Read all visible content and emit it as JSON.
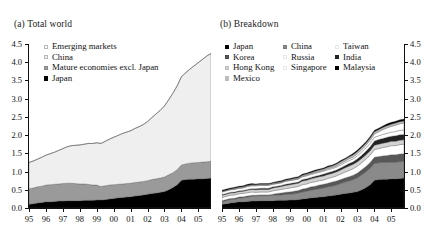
{
  "figure": {
    "panel_a_title": "(a) Total world",
    "panel_b_title": "(b) Breakdown"
  },
  "axes": {
    "y_ticks": [
      "0.0",
      "0.5",
      "1.0",
      "1.5",
      "2.0",
      "2.5",
      "3.0",
      "3.5",
      "4.0",
      "4.5"
    ],
    "x_ticks": [
      "95",
      "96",
      "97",
      "98",
      "99",
      "00",
      "01",
      "02",
      "03",
      "04",
      "05"
    ],
    "ylim": [
      0,
      4.5
    ],
    "xlim": [
      1995,
      2005.75
    ]
  },
  "colors": {
    "black": "#000000",
    "dark_gray": "#3b3b3b",
    "mid_gray": "#808080",
    "gray": "#a0a0a0",
    "light_gray": "#c9c9c9",
    "lighter_gray": "#dedede",
    "near_white": "#efefef",
    "white": "#ffffff",
    "axis": "#111111"
  },
  "legend_a": [
    {
      "label": "Emerging markets",
      "color": "#ffffff"
    },
    {
      "label": "China",
      "color": "#efefef"
    },
    {
      "label": "Mature economies excl. Japan",
      "color": "#9a9a9a"
    },
    {
      "label": "Japan",
      "color": "#000000"
    }
  ],
  "legend_b_columns": [
    [
      {
        "label": "Japan",
        "color": "#000000"
      },
      {
        "label": "Korea",
        "color": "#585858"
      },
      {
        "label": "Hong Kong",
        "color": "#d2d2d2"
      },
      {
        "label": "Mexico",
        "color": "#bdbdbd"
      }
    ],
    [
      {
        "label": "China",
        "color": "#8a8a8a"
      },
      {
        "label": "Russia",
        "color": "#ffffff"
      },
      {
        "label": "Singapore",
        "color": "#ffffff"
      }
    ],
    [
      {
        "label": "Taiwan",
        "color": "#ffffff"
      },
      {
        "label": "India",
        "color": "#222222"
      },
      {
        "label": "Malaysia",
        "color": "#000000"
      }
    ]
  ],
  "chart_data": [
    {
      "type": "area",
      "stacked": true,
      "title": "(a) Total world",
      "xlabel": "",
      "ylabel": "",
      "ylim": [
        0,
        4.5
      ],
      "grid": false,
      "legend_position": "top-left",
      "x": [
        1995.0,
        1995.25,
        1995.5,
        1995.75,
        1996.0,
        1996.25,
        1996.5,
        1996.75,
        1997.0,
        1997.25,
        1997.5,
        1997.75,
        1998.0,
        1998.25,
        1998.5,
        1998.75,
        1999.0,
        1999.25,
        1999.5,
        1999.75,
        2000.0,
        2000.25,
        2000.5,
        2000.75,
        2001.0,
        2001.25,
        2001.5,
        2001.75,
        2002.0,
        2002.25,
        2002.5,
        2002.75,
        2003.0,
        2003.25,
        2003.5,
        2003.75,
        2004.0,
        2004.25,
        2004.5,
        2004.75,
        2005.0,
        2005.25,
        2005.5,
        2005.75
      ],
      "x_tick_labels": [
        "95",
        "96",
        "97",
        "98",
        "99",
        "00",
        "01",
        "02",
        "03",
        "04",
        "05"
      ],
      "series": [
        {
          "name": "Japan",
          "color": "#000000",
          "values": [
            0.1,
            0.12,
            0.14,
            0.15,
            0.17,
            0.17,
            0.18,
            0.19,
            0.19,
            0.2,
            0.2,
            0.2,
            0.2,
            0.21,
            0.21,
            0.21,
            0.22,
            0.22,
            0.23,
            0.25,
            0.26,
            0.28,
            0.29,
            0.3,
            0.31,
            0.33,
            0.34,
            0.36,
            0.38,
            0.4,
            0.41,
            0.43,
            0.45,
            0.5,
            0.56,
            0.64,
            0.76,
            0.78,
            0.79,
            0.79,
            0.8,
            0.8,
            0.81,
            0.82
          ]
        },
        {
          "name": "Mature economies excl. Japan",
          "color": "#9a9a9a",
          "values": [
            0.43,
            0.43,
            0.44,
            0.45,
            0.46,
            0.47,
            0.47,
            0.47,
            0.48,
            0.48,
            0.48,
            0.47,
            0.46,
            0.45,
            0.44,
            0.42,
            0.41,
            0.37,
            0.38,
            0.38,
            0.38,
            0.37,
            0.37,
            0.37,
            0.37,
            0.37,
            0.37,
            0.37,
            0.37,
            0.38,
            0.39,
            0.39,
            0.4,
            0.41,
            0.41,
            0.41,
            0.42,
            0.43,
            0.44,
            0.45,
            0.45,
            0.46,
            0.46,
            0.46
          ]
        },
        {
          "name": "China",
          "color": "#efefef",
          "values": [
            0.72,
            0.74,
            0.76,
            0.79,
            0.82,
            0.85,
            0.88,
            0.92,
            0.96,
            1.0,
            1.03,
            1.05,
            1.07,
            1.09,
            1.12,
            1.14,
            1.16,
            1.18,
            1.22,
            1.26,
            1.3,
            1.34,
            1.38,
            1.41,
            1.44,
            1.48,
            1.52,
            1.56,
            1.62,
            1.7,
            1.78,
            1.86,
            1.95,
            2.06,
            2.18,
            2.3,
            2.42,
            2.5,
            2.58,
            2.66,
            2.74,
            2.82,
            2.9,
            2.96
          ]
        },
        {
          "name": "Emerging markets",
          "color": "#ffffff",
          "values": [
            0.0,
            0.0,
            0.0,
            0.0,
            0.0,
            0.0,
            0.0,
            0.0,
            0.0,
            0.0,
            0.0,
            0.0,
            0.0,
            0.0,
            0.0,
            0.0,
            0.0,
            0.0,
            0.0,
            0.0,
            0.0,
            0.0,
            0.0,
            0.0,
            0.0,
            0.0,
            0.0,
            0.0,
            0.0,
            0.0,
            0.0,
            0.0,
            0.0,
            0.0,
            0.0,
            0.0,
            0.0,
            0.0,
            0.0,
            0.0,
            0.0,
            0.0,
            0.0,
            0.0
          ]
        }
      ]
    },
    {
      "type": "area",
      "stacked": true,
      "title": "(b) Breakdown",
      "xlabel": "",
      "ylabel": "",
      "ylim": [
        0,
        4.5
      ],
      "grid": false,
      "legend_position": "top-left",
      "x": [
        1995.0,
        1995.25,
        1995.5,
        1995.75,
        1996.0,
        1996.25,
        1996.5,
        1996.75,
        1997.0,
        1997.25,
        1997.5,
        1997.75,
        1998.0,
        1998.25,
        1998.5,
        1998.75,
        1999.0,
        1999.25,
        1999.5,
        1999.75,
        2000.0,
        2000.25,
        2000.5,
        2000.75,
        2001.0,
        2001.25,
        2001.5,
        2001.75,
        2002.0,
        2002.25,
        2002.5,
        2002.75,
        2003.0,
        2003.25,
        2003.5,
        2003.75,
        2004.0,
        2004.25,
        2004.5,
        2004.75,
        2005.0,
        2005.25,
        2005.5,
        2005.75
      ],
      "x_tick_labels": [
        "95",
        "96",
        "97",
        "98",
        "99",
        "00",
        "01",
        "02",
        "03",
        "04",
        "05"
      ],
      "series": [
        {
          "name": "Japan",
          "color": "#000000",
          "values": [
            0.1,
            0.12,
            0.14,
            0.15,
            0.17,
            0.17,
            0.18,
            0.19,
            0.19,
            0.2,
            0.2,
            0.2,
            0.2,
            0.21,
            0.21,
            0.21,
            0.22,
            0.22,
            0.23,
            0.25,
            0.26,
            0.28,
            0.29,
            0.3,
            0.31,
            0.33,
            0.34,
            0.36,
            0.38,
            0.4,
            0.41,
            0.43,
            0.45,
            0.5,
            0.56,
            0.64,
            0.76,
            0.78,
            0.79,
            0.79,
            0.8,
            0.8,
            0.81,
            0.82
          ]
        },
        {
          "name": "China",
          "color": "#8a8a8a",
          "values": [
            0.07,
            0.08,
            0.09,
            0.09,
            0.1,
            0.11,
            0.12,
            0.13,
            0.14,
            0.14,
            0.14,
            0.14,
            0.15,
            0.15,
            0.15,
            0.16,
            0.16,
            0.17,
            0.18,
            0.19,
            0.2,
            0.21,
            0.22,
            0.23,
            0.24,
            0.25,
            0.26,
            0.27,
            0.29,
            0.31,
            0.33,
            0.35,
            0.38,
            0.41,
            0.43,
            0.45,
            0.46,
            0.46,
            0.46,
            0.46,
            0.46,
            0.46,
            0.46,
            0.46
          ]
        },
        {
          "name": "Korea",
          "color": "#585858",
          "values": [
            0.03,
            0.03,
            0.03,
            0.03,
            0.03,
            0.03,
            0.03,
            0.03,
            0.02,
            0.02,
            0.02,
            0.02,
            0.03,
            0.04,
            0.05,
            0.06,
            0.06,
            0.07,
            0.07,
            0.08,
            0.08,
            0.09,
            0.09,
            0.1,
            0.1,
            0.1,
            0.11,
            0.11,
            0.11,
            0.11,
            0.12,
            0.12,
            0.13,
            0.14,
            0.15,
            0.16,
            0.17,
            0.17,
            0.18,
            0.19,
            0.2,
            0.2,
            0.21,
            0.21
          ]
        },
        {
          "name": "Taiwan",
          "color": "#ffffff",
          "values": [
            0.09,
            0.09,
            0.09,
            0.09,
            0.09,
            0.09,
            0.09,
            0.09,
            0.08,
            0.08,
            0.08,
            0.08,
            0.09,
            0.09,
            0.1,
            0.1,
            0.11,
            0.11,
            0.11,
            0.12,
            0.12,
            0.12,
            0.12,
            0.12,
            0.12,
            0.13,
            0.13,
            0.14,
            0.15,
            0.16,
            0.17,
            0.18,
            0.19,
            0.19,
            0.2,
            0.2,
            0.21,
            0.22,
            0.23,
            0.24,
            0.25,
            0.25,
            0.26,
            0.26
          ]
        },
        {
          "name": "Hong Kong",
          "color": "#d2d2d2",
          "values": [
            0.06,
            0.06,
            0.06,
            0.06,
            0.06,
            0.06,
            0.07,
            0.07,
            0.07,
            0.07,
            0.07,
            0.07,
            0.08,
            0.08,
            0.08,
            0.09,
            0.09,
            0.09,
            0.09,
            0.1,
            0.1,
            0.1,
            0.11,
            0.11,
            0.11,
            0.11,
            0.11,
            0.11,
            0.11,
            0.12,
            0.12,
            0.12,
            0.12,
            0.12,
            0.12,
            0.12,
            0.12,
            0.12,
            0.12,
            0.12,
            0.12,
            0.12,
            0.12,
            0.12
          ]
        },
        {
          "name": "India",
          "color": "#222222",
          "values": [
            0.02,
            0.02,
            0.02,
            0.02,
            0.02,
            0.02,
            0.02,
            0.02,
            0.03,
            0.03,
            0.03,
            0.03,
            0.03,
            0.03,
            0.03,
            0.03,
            0.03,
            0.03,
            0.03,
            0.04,
            0.04,
            0.04,
            0.04,
            0.04,
            0.05,
            0.05,
            0.05,
            0.05,
            0.06,
            0.06,
            0.07,
            0.07,
            0.08,
            0.09,
            0.1,
            0.11,
            0.12,
            0.13,
            0.13,
            0.14,
            0.14,
            0.15,
            0.15,
            0.15
          ]
        },
        {
          "name": "Singapore",
          "color": "#ffffff",
          "values": [
            0.07,
            0.07,
            0.07,
            0.07,
            0.07,
            0.07,
            0.08,
            0.08,
            0.08,
            0.08,
            0.08,
            0.08,
            0.07,
            0.07,
            0.07,
            0.08,
            0.08,
            0.08,
            0.08,
            0.08,
            0.08,
            0.08,
            0.08,
            0.08,
            0.08,
            0.08,
            0.08,
            0.08,
            0.08,
            0.08,
            0.08,
            0.08,
            0.08,
            0.09,
            0.09,
            0.1,
            0.1,
            0.1,
            0.11,
            0.11,
            0.11,
            0.12,
            0.12,
            0.12
          ]
        },
        {
          "name": "Russia",
          "color": "#ffffff",
          "values": [
            0.01,
            0.01,
            0.01,
            0.01,
            0.01,
            0.01,
            0.01,
            0.01,
            0.01,
            0.01,
            0.01,
            0.01,
            0.01,
            0.01,
            0.01,
            0.01,
            0.01,
            0.01,
            0.01,
            0.01,
            0.02,
            0.02,
            0.02,
            0.02,
            0.02,
            0.03,
            0.03,
            0.03,
            0.04,
            0.04,
            0.05,
            0.05,
            0.06,
            0.06,
            0.07,
            0.08,
            0.09,
            0.11,
            0.13,
            0.15,
            0.16,
            0.17,
            0.18,
            0.19
          ]
        },
        {
          "name": "Mexico",
          "color": "#bdbdbd",
          "values": [
            0.01,
            0.01,
            0.01,
            0.02,
            0.02,
            0.02,
            0.02,
            0.02,
            0.02,
            0.02,
            0.02,
            0.02,
            0.02,
            0.02,
            0.02,
            0.02,
            0.02,
            0.03,
            0.03,
            0.03,
            0.03,
            0.03,
            0.04,
            0.04,
            0.04,
            0.04,
            0.04,
            0.05,
            0.05,
            0.05,
            0.05,
            0.06,
            0.06,
            0.06,
            0.06,
            0.06,
            0.06,
            0.06,
            0.06,
            0.06,
            0.06,
            0.06,
            0.06,
            0.06
          ]
        },
        {
          "name": "Malaysia",
          "color": "#000000",
          "values": [
            0.03,
            0.03,
            0.03,
            0.03,
            0.03,
            0.03,
            0.03,
            0.03,
            0.02,
            0.02,
            0.02,
            0.02,
            0.02,
            0.03,
            0.03,
            0.03,
            0.03,
            0.03,
            0.03,
            0.03,
            0.03,
            0.03,
            0.03,
            0.03,
            0.03,
            0.03,
            0.03,
            0.03,
            0.03,
            0.03,
            0.03,
            0.04,
            0.04,
            0.04,
            0.04,
            0.04,
            0.04,
            0.04,
            0.04,
            0.05,
            0.05,
            0.05,
            0.05,
            0.05
          ]
        }
      ]
    }
  ]
}
